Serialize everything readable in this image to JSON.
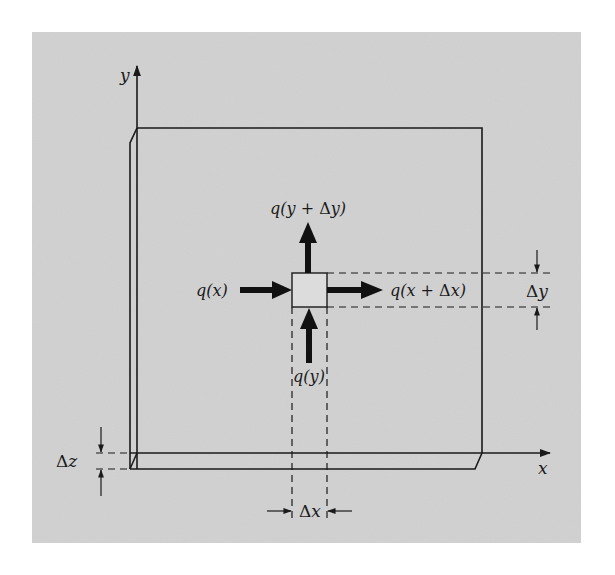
{
  "figure": {
    "background": "#ffffff",
    "panel_color": "#d2d2d2",
    "line_color": "#1a1a1a",
    "axes": {
      "x_label": "x",
      "y_label": "y"
    },
    "fluxes": {
      "q_x": {
        "prefix": "q(",
        "var": "x",
        "suffix": ")"
      },
      "q_x_dx": {
        "prefix": "q(",
        "var": "x",
        "plus": " + ",
        "delta": "Δ",
        "dvar": "x",
        "suffix": ")"
      },
      "q_y": {
        "prefix": "q(",
        "var": "y",
        "suffix": ")"
      },
      "q_y_dy": {
        "prefix": "q(",
        "var": "y",
        "plus": " + ",
        "delta": "Δ",
        "dvar": "y",
        "suffix": ")"
      }
    },
    "dimensions": {
      "dx": {
        "delta": "Δ",
        "var": "x"
      },
      "dy": {
        "delta": "Δ",
        "var": "y"
      },
      "dz": {
        "delta": "Δ",
        "var": "z"
      }
    }
  }
}
